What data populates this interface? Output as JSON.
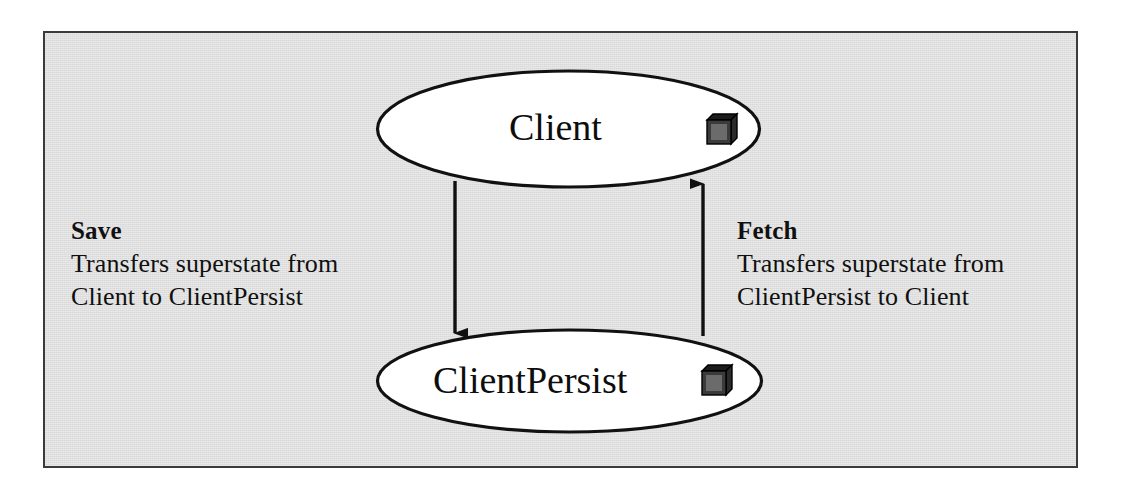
{
  "diagram": {
    "background_color": "#d9d9d9",
    "frame_border_color": "#3a3a3a",
    "stroke_color": "#111111",
    "node_fill_color": "#ffffff"
  },
  "nodes": [
    {
      "id": "client",
      "label": "Client",
      "icon": "component-cube-icon",
      "shape": "ellipse",
      "position": "top"
    },
    {
      "id": "clientpersist",
      "label": "ClientPersist",
      "icon": "component-cube-icon",
      "shape": "ellipse",
      "position": "bottom"
    }
  ],
  "annotations": [
    {
      "id": "save",
      "title": "Save",
      "lines": [
        "Transfers superstate from",
        "Client to ClientPersist"
      ],
      "side": "left"
    },
    {
      "id": "fetch",
      "title": "Fetch",
      "lines": [
        "Transfers superstate from",
        "ClientPersist to Client"
      ],
      "side": "right"
    }
  ],
  "edges": [
    {
      "id": "save-edge",
      "from": "client",
      "to": "clientpersist",
      "direction": "down",
      "arrowhead": "solid-triangle"
    },
    {
      "id": "fetch-edge",
      "from": "clientpersist",
      "to": "client",
      "direction": "up",
      "arrowhead": "solid-triangle"
    }
  ]
}
